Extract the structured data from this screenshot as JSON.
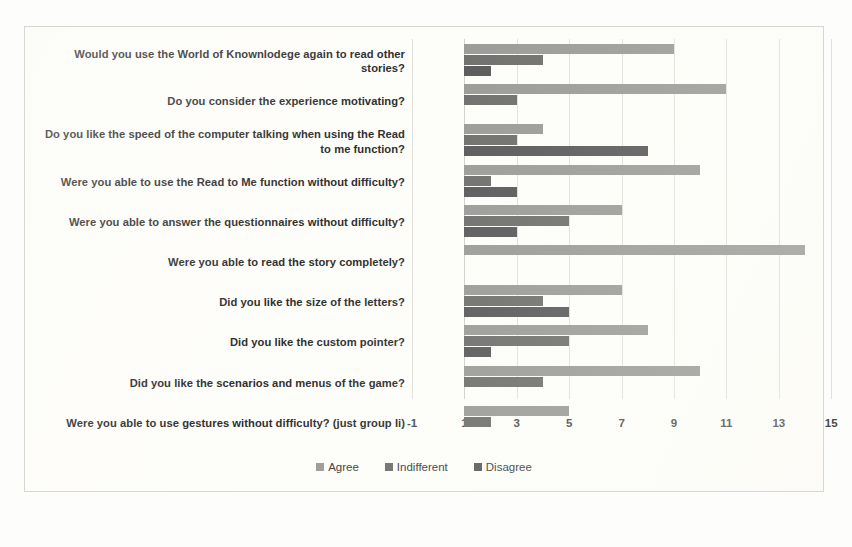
{
  "chart_data": {
    "type": "bar",
    "orientation": "horizontal",
    "title": "",
    "xlabel": "",
    "ylabel": "",
    "xlim": [
      -1,
      15
    ],
    "xticks": [
      "-1",
      "1",
      "3",
      "5",
      "7",
      "9",
      "11",
      "13",
      "15"
    ],
    "xtick_values": [
      -1,
      1,
      3,
      5,
      7,
      9,
      11,
      13,
      15
    ],
    "grid": true,
    "legend_position": "bottom",
    "bar_base": 1,
    "categories": [
      "Would you use the World of Knownlodege again to read other stories?",
      "Do you consider the experience motivating?",
      "Do you like the speed of the computer talking when using the Read to me function?",
      "Were you able to use the Read to Me function without difficulty?",
      "Were you able to answer the questionnaires without difficulty?",
      "Were you able to read the story completely?",
      "Did you like the size of the letters?",
      "Did you like the custom pointer?",
      "Did you like the scenarios and menus of the game?",
      "Were you able to use gestures without difficulty? (just group Ii)"
    ],
    "series": [
      {
        "name": "Agree",
        "color": "#9a9a98",
        "values": [
          9,
          11,
          4,
          10,
          7,
          14,
          7,
          8,
          10,
          5
        ]
      },
      {
        "name": "Indifferent",
        "color": "#6e6e6c",
        "values": [
          4,
          3,
          3,
          2,
          5,
          0,
          4,
          5,
          4,
          2
        ]
      },
      {
        "name": "Disagree",
        "color": "#59595a",
        "values": [
          2,
          1,
          8,
          3,
          3,
          1,
          5,
          2,
          1,
          1
        ]
      }
    ]
  },
  "legend": {
    "items": [
      {
        "label": "Agree"
      },
      {
        "label": "Indifferent"
      },
      {
        "label": "Disagree"
      }
    ]
  }
}
